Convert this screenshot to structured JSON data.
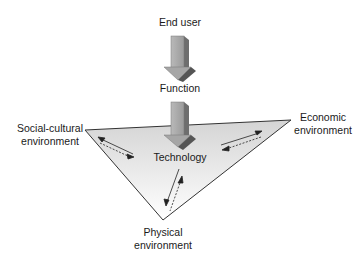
{
  "diagram": {
    "top_label": "End user",
    "middle_label": "Function",
    "center_label": "Technology",
    "corners": {
      "left": [
        "Social-cultural",
        "environment"
      ],
      "right": [
        "Economic",
        "environment"
      ],
      "bottom": [
        "Physical",
        "environment"
      ]
    },
    "colors": {
      "arrow_front": "#a8a8a8",
      "arrow_side": "#6e6e6e",
      "arrow_head_dark": "#555555",
      "triangle_top": "#dcdcdc",
      "triangle_bottom": "#ffffff",
      "stroke": "#333333"
    }
  }
}
